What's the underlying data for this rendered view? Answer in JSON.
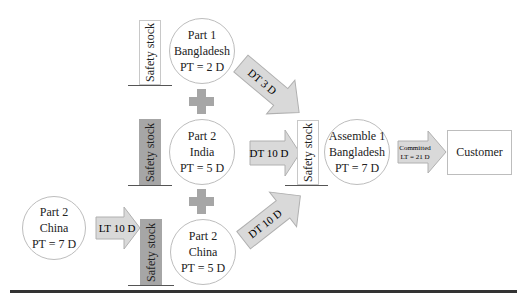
{
  "nodes": {
    "part1_bangladesh": {
      "line1": "Part 1",
      "line2": "Bangladesh",
      "line3": "PT = 2 D"
    },
    "part2_india": {
      "line1": "Part 2",
      "line2": "India",
      "line3": "PT = 5 D"
    },
    "part2_china_supplier": {
      "line1": "Part 2",
      "line2": "China",
      "line3": "PT = 7 D"
    },
    "part2_china": {
      "line1": "Part 2",
      "line2": "China",
      "line3": "PT = 5 D"
    },
    "assemble1_bangladesh": {
      "line1": "Assemble 1",
      "line2": "Bangladesh",
      "line3": "PT = 7 D"
    },
    "customer": {
      "label": "Customer"
    }
  },
  "safety_stocks": {
    "part1": "Safety stock",
    "part2_india": "Safety stock",
    "part2_china": "Safety stock",
    "assembly": "Safety stock"
  },
  "arrows": {
    "dt_part1": "DT 3 D",
    "dt_india": "DT 10 D",
    "dt_china": "DT 10 D",
    "lt_china": "LT 10 D",
    "committed_line1": "Committed",
    "committed_line2": "LT = 21 D"
  },
  "colors": {
    "arrow_fill": "#d9d9d9",
    "arrow_stroke": "#b0b0b0",
    "plus_fill": "#a6a6a6",
    "safety_stock_gray": "#a6a6a6"
  }
}
